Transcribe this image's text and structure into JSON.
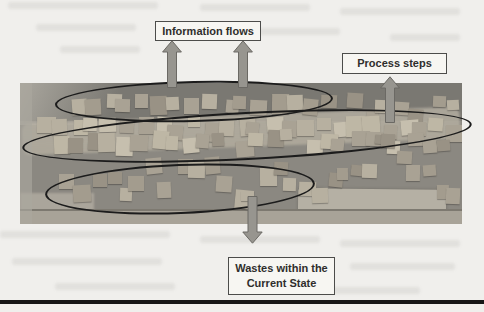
{
  "page": {
    "background": "#f0efec",
    "footer_rule_color": "#161616"
  },
  "figure": {
    "labels": {
      "information_flows": "Information flows",
      "process_steps": "Process steps",
      "wastes_line1": "Wastes within the",
      "wastes_line2": "Current State"
    },
    "annotation": {
      "ellipse_color": "#1c1c1c",
      "arrow_color": "#97958f",
      "arrow_outline": "#6b6964",
      "box_fill": "#f7f6f2",
      "box_border": "#4c4c4a",
      "text_color": "#2f2e2c"
    },
    "photo": {
      "wall_dark": "#7a7872",
      "wall_mid": "#8b8881",
      "band_light": "#b3ad9f",
      "paper_light": "#b5b0a4",
      "ledge_light": "#a8a398",
      "note_palette": [
        "#c6bfae",
        "#b7b0a0",
        "#a9a294",
        "#999285",
        "#8c8679",
        "#beb7a5",
        "#a39c8e"
      ]
    }
  }
}
